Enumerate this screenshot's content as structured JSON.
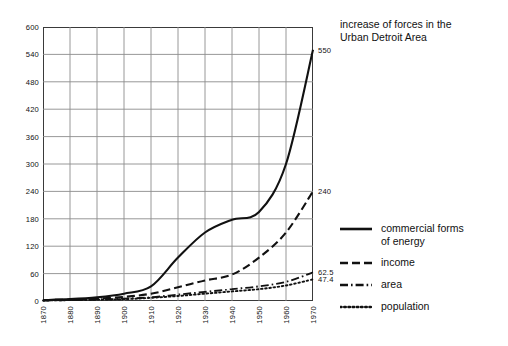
{
  "title": {
    "text": "increase of forces in the\nUrban Detroit Area"
  },
  "legend": {
    "items": [
      {
        "label": "commercial forms\nof energy",
        "style": "solid",
        "icon": "solid-line-icon"
      },
      {
        "label": "income",
        "style": "dashed",
        "icon": "dashed-line-icon"
      },
      {
        "label": "area",
        "style": "dashdot",
        "icon": "dash-dot-line-icon"
      },
      {
        "label": "population",
        "style": "dotted",
        "icon": "dotted-line-icon"
      }
    ]
  },
  "axes": {
    "y_ticks": [
      "0",
      "60",
      "120",
      "180",
      "240",
      "300",
      "360",
      "420",
      "480",
      "540",
      "600"
    ],
    "x_ticks": [
      "1870",
      "1880",
      "1890",
      "1900",
      "1910",
      "1920",
      "1930",
      "1940",
      "1950",
      "1960",
      "1970"
    ]
  },
  "end_labels": [
    {
      "series": "commercial forms of energy",
      "value": "550"
    },
    {
      "series": "income",
      "value": "240"
    },
    {
      "series": "area",
      "value": "62.5"
    },
    {
      "series": "population",
      "value": "47.4"
    }
  ],
  "colors": {
    "ink": "#111111",
    "frame": "#3a3a3a",
    "grid": "#8c8c8c",
    "background": "#ffffff"
  },
  "chart_data": {
    "type": "line",
    "title": "increase of forces in the Urban Detroit Area",
    "xlabel": "",
    "ylabel": "",
    "xlim": [
      1870,
      1970
    ],
    "ylim": [
      0,
      600
    ],
    "xtick_step": 10,
    "ytick_step": 60,
    "grid": true,
    "legend_position": "right",
    "x": [
      1870,
      1880,
      1890,
      1900,
      1910,
      1920,
      1930,
      1940,
      1950,
      1960,
      1970
    ],
    "series": [
      {
        "name": "commercial forms of energy",
        "style": "solid",
        "end_value": 550,
        "values": [
          2,
          4,
          8,
          16,
          32,
          95,
          150,
          178,
          195,
          300,
          550
        ]
      },
      {
        "name": "income",
        "style": "dashed",
        "end_value": 240,
        "values": [
          2,
          3,
          5,
          9,
          16,
          30,
          45,
          58,
          95,
          150,
          240
        ]
      },
      {
        "name": "area",
        "style": "dashdot",
        "end_value": 62.5,
        "values": [
          1,
          2,
          3,
          5,
          8,
          14,
          20,
          26,
          32,
          42,
          62.5
        ]
      },
      {
        "name": "population",
        "style": "dotted",
        "end_value": 47.4,
        "values": [
          1,
          2,
          3,
          4,
          7,
          11,
          16,
          21,
          26,
          34,
          47.4
        ]
      }
    ]
  }
}
